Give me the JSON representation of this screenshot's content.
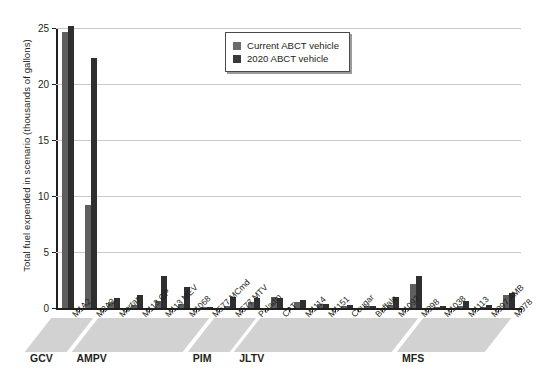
{
  "chart_data": {
    "type": "bar",
    "title": "",
    "xlabel": "",
    "ylabel": "Total fuel expended in scenario (thousands of gallons)",
    "ylim": [
      0,
      25
    ],
    "yticks": [
      0,
      5,
      10,
      15,
      20,
      25
    ],
    "grid": true,
    "legend_position": "top-center",
    "categories": [
      "M1A2",
      "M2A3",
      "Mortar",
      "M113 GP",
      "M113 MEV",
      "M1068",
      "M577 MCmd",
      "M577 MTV",
      "Paladin",
      "CAT",
      "M1114",
      "M1151",
      "Cougar",
      "Buffalo",
      "M1097",
      "M998",
      "M1038",
      "M1113",
      "M997 AMB",
      "M978"
    ],
    "series": [
      {
        "name": "Current ABCT vehicle",
        "color": "#5f5f5f",
        "values": [
          24.6,
          9.2,
          0.5,
          0.3,
          0.6,
          0.4,
          0.05,
          0.2,
          0.5,
          1.0,
          0.55,
          0.35,
          0.2,
          0.15,
          0.3,
          2.1,
          0.1,
          0.2,
          0.1,
          1.2
        ]
      },
      {
        "name": "2020 ABCT vehicle",
        "color": "#2f2f2f",
        "values": [
          25.2,
          22.3,
          0.9,
          1.2,
          2.9,
          1.9,
          0.1,
          1.0,
          0.85,
          0.9,
          0.7,
          0.35,
          0.25,
          0.2,
          0.95,
          2.85,
          0.15,
          0.6,
          0.3,
          1.35
        ]
      }
    ],
    "groups": [
      {
        "label": "GCV",
        "start": 0,
        "end": 1
      },
      {
        "label": "AMPV",
        "start": 2,
        "end": 6
      },
      {
        "label": "PIM",
        "start": 7,
        "end": 8
      },
      {
        "label": "JLTV",
        "start": 9,
        "end": 15
      },
      {
        "label": "MFS",
        "start": 16,
        "end": 19
      }
    ]
  },
  "legend": {
    "items": [
      {
        "label": "Current ABCT vehicle"
      },
      {
        "label": "2020 ABCT vehicle"
      }
    ]
  },
  "axis": {
    "y_title": "Total fuel expended in scenario (thousands of gallons)",
    "ticks": [
      "0",
      "5",
      "10",
      "15",
      "20",
      "25"
    ]
  },
  "bands": [
    {
      "label": "GCV"
    },
    {
      "label": "AMPV"
    },
    {
      "label": "PIM"
    },
    {
      "label": "JLTV"
    },
    {
      "label": "MFS"
    }
  ]
}
